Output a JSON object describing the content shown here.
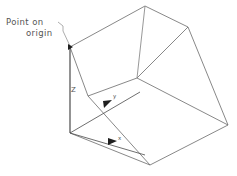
{
  "figure": {
    "title_annotation": {
      "line1": "Point on",
      "line2": "origin"
    },
    "axes": {
      "z_label": "Z",
      "y_label": "y",
      "x_label": "x"
    },
    "colors": {
      "line": "#666666",
      "line_dark": "#444444",
      "text": "#555555",
      "background": "#ffffff"
    },
    "geometry": {
      "type": "isometric-wireframe-box",
      "vertices": {
        "origin": [
          70,
          47
        ],
        "top_apex": [
          145,
          6
        ],
        "top_right": [
          188,
          27
        ],
        "mid_front": [
          137,
          78
        ],
        "mid_left": [
          88,
          96
        ],
        "right": [
          228,
          125
        ],
        "bottom": [
          150,
          165
        ],
        "origin_bottom": [
          70,
          133
        ],
        "front_lower_left": [
          88,
          96
        ]
      },
      "edges": [
        [
          "origin",
          "top_apex"
        ],
        [
          "top_apex",
          "top_right"
        ],
        [
          "origin",
          "mid_left"
        ],
        [
          "mid_left",
          "mid_front"
        ],
        [
          "mid_front",
          "top_apex"
        ],
        [
          "mid_front",
          "right"
        ],
        [
          "top_right",
          "right"
        ],
        [
          "origin",
          "origin_bottom"
        ],
        [
          "origin_bottom",
          "bottom"
        ],
        [
          "bottom",
          "right"
        ],
        [
          "mid_left",
          "bottom"
        ]
      ]
    }
  }
}
